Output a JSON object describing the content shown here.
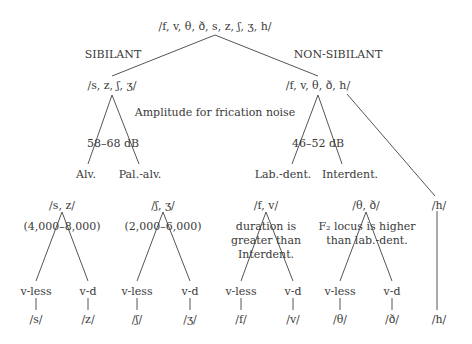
{
  "root": "/f, v, θ, ð, s, z, ʃ, ʒ, h/",
  "branch_labels": {
    "left": "SIBILANT",
    "right": "NON-SIBILANT"
  },
  "sibilant": {
    "node": "/s, z, ʃ, ʒ/",
    "amplitude": "58–68 dB",
    "places": [
      "Alv.",
      "Pal.-alv."
    ]
  },
  "non_sibilant": {
    "node": "/f, v, θ, ð, h/",
    "amplitude": "46–52 dB",
    "places": [
      "Lab.-dent.",
      "Interdent."
    ]
  },
  "amplitude_caption": "Amplitude for frication noise",
  "groups": [
    {
      "node": "/s, z/",
      "annotation": [
        "(4,000–8,000)"
      ],
      "voicing": [
        "v-less",
        "v-d"
      ],
      "leaves": [
        "/s/",
        "/z/"
      ]
    },
    {
      "node": "/ʃ, ʒ/",
      "annotation": [
        "(2,000–6,000)"
      ],
      "voicing": [
        "v-less",
        "v-d"
      ],
      "leaves": [
        "/ʃ/",
        "/ʒ/"
      ]
    },
    {
      "node": "/f, v/",
      "annotation": [
        "duration is",
        "greater than",
        "Interdent."
      ],
      "voicing": [
        "v-less",
        "v-d"
      ],
      "leaves": [
        "/f/",
        "/v/"
      ]
    },
    {
      "node": "/θ, ð/",
      "annotation": [
        "F₂ locus is higher",
        "than lab.-dent."
      ],
      "voicing": [
        "v-less",
        "v-d"
      ],
      "leaves": [
        "/θ/",
        "/ð/"
      ]
    },
    {
      "node": "/h/",
      "leaves": [
        "/h/"
      ]
    }
  ]
}
